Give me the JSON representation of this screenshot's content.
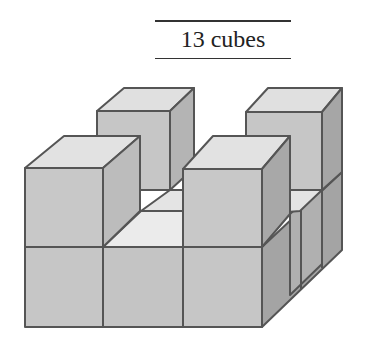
{
  "caption": {
    "text": "13 cubes"
  },
  "figure": {
    "cube_count": 13,
    "colors": {
      "front": "#c8c8c8",
      "top": "#e2e2e2",
      "side": "#a8a8a8",
      "gap_top": "#ececec",
      "edge": "#555555"
    }
  }
}
